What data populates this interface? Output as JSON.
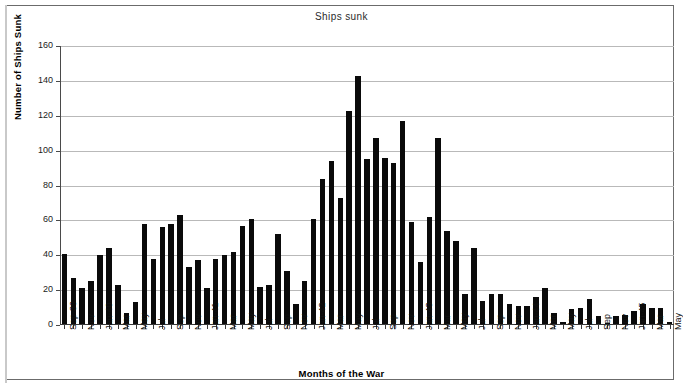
{
  "chart_data": {
    "type": "bar",
    "title": "Ships sunk",
    "xlabel": "Months of the War",
    "ylabel": "Number of Ships Sunk",
    "ylim": [
      0,
      160
    ],
    "ytick_values": [
      0,
      20,
      40,
      60,
      80,
      100,
      120,
      140,
      160
    ],
    "grid": true,
    "legend": null,
    "bar_color": "#0a0a0a",
    "gridline_color": "#b9b9b9",
    "axis_color": "#3a3a3a",
    "tick_label_every_n": 2,
    "categories": [
      "Sep-39",
      "Oct-39",
      "Nov-39",
      "Dec-39",
      "Jan-40",
      "Feb-40",
      "Mar-40",
      "Apr-40",
      "May-40",
      "Jun-40",
      "Jul-40",
      "Aug-40",
      "Sep-40",
      "Oct-40",
      "Nov-40",
      "Dec-40",
      "Jan-41",
      "Feb-41",
      "Mar-41",
      "Apr-41",
      "May-41",
      "Jun-41",
      "Jul-41",
      "Aug-41",
      "Sep-41",
      "Oct-41",
      "Nov-41",
      "Dec-41",
      "Jan-42",
      "Feb-42",
      "Mar-42",
      "Apr-42",
      "May-42",
      "Jun-42",
      "Jul-42",
      "Aug-42",
      "Sep-42",
      "Oct-42",
      "Nov-42",
      "Dec-42",
      "Jan-43",
      "Feb-43",
      "Mar-43",
      "Apr-43",
      "May-43",
      "Jun-43",
      "Jul-43",
      "Aug-43",
      "Sep-43",
      "Oct-43",
      "Nov-43",
      "Dec-43",
      "Jan-44",
      "Feb-44",
      "Mar-44",
      "Apr-44",
      "May-44",
      "Jun-44",
      "Jul-44",
      "Aug-44",
      "Sep-44",
      "Oct-44",
      "Nov-44",
      "Dec-44",
      "Jan-45",
      "Feb-45",
      "Mar-45",
      "Apr-45",
      "May-45"
    ],
    "tick_labels": [
      "Sep-39",
      "Nov",
      "Jan-40",
      "Mar",
      "May",
      "Jul",
      "Sep",
      "Nov",
      "Jan-41",
      "Mar",
      "May",
      "Jul",
      "Sep",
      "Nov",
      "Jan-42",
      "Mar",
      "May",
      "Jul",
      "Sep",
      "Nov",
      "Jan-43",
      "Mar",
      "May",
      "Jul",
      "Sep",
      "Nov",
      "Jan-44",
      "Mar",
      "May",
      "Jul",
      "Sep",
      "Nov",
      "Jan-45",
      "Mar",
      "May"
    ],
    "values": [
      41,
      27,
      21,
      25,
      40,
      44,
      23,
      7,
      13,
      58,
      38,
      56,
      58,
      63,
      33,
      37,
      21,
      38,
      40,
      42,
      57,
      61,
      22,
      23,
      52,
      31,
      12,
      25,
      61,
      84,
      94,
      73,
      123,
      143,
      95,
      107,
      96,
      93,
      117,
      59,
      36,
      62,
      107,
      54,
      48,
      18,
      44,
      14,
      18,
      18,
      12,
      11,
      11,
      16,
      21,
      7,
      2,
      9,
      10,
      15,
      5,
      1,
      5,
      6,
      8,
      12,
      10,
      10,
      2
    ]
  }
}
